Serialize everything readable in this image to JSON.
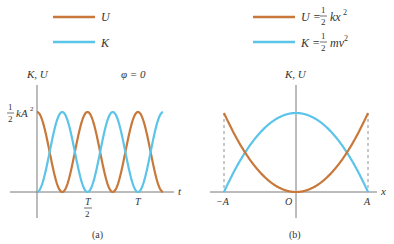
{
  "colors": {
    "U": "#c8783a",
    "K": "#5bc4e8",
    "axis": "#555555"
  },
  "legend_a": {
    "U_label": "U",
    "K_label": "K"
  },
  "legend_b": {
    "U_lhs": "U =",
    "U_frac_num": "1",
    "U_frac_den": "2",
    "U_rhs": "kx",
    "U_exp": "2",
    "K_lhs": "K =",
    "K_frac_num": "1",
    "K_frac_den": "2",
    "K_rhs": "mv",
    "K_exp": "2"
  },
  "panel_a": {
    "y_axis_label": "K, U",
    "phase_label": "φ = 0",
    "max_label_num": "1",
    "max_label_den": "2",
    "max_label_rhs": "kA",
    "max_label_exp": "2",
    "x_axis_label": "t",
    "tick_half_T_num": "T",
    "tick_half_T_den": "2",
    "tick_T": "T",
    "caption": "(a)"
  },
  "panel_b": {
    "y_axis_label": "K, U",
    "x_axis_label": "x",
    "tick_neg_A": "−A",
    "tick_O": "O",
    "tick_A": "A",
    "caption": "(b)"
  },
  "chart_data": [
    {
      "type": "line",
      "title": "(a) Energy vs time, φ = 0",
      "xlabel": "t",
      "ylabel": "K, U",
      "x_ticks": [
        "T/2",
        "T"
      ],
      "y_ticks": [
        "1/2 kA^2"
      ],
      "series": [
        {
          "name": "U",
          "formula": "(1/2)kA^2 cos^2(ωt)",
          "start": "max"
        },
        {
          "name": "K",
          "formula": "(1/2)kA^2 sin^2(ωt)",
          "start": "zero"
        }
      ],
      "x_range": [
        0,
        1.25
      ],
      "x_units": "T"
    },
    {
      "type": "line",
      "title": "(b) Energy vs position",
      "xlabel": "x",
      "ylabel": "K, U",
      "x_ticks": [
        "-A",
        "O",
        "A"
      ],
      "series": [
        {
          "name": "U",
          "formula": "U = (1/2)kx^2",
          "shape": "parabola, minimum at O"
        },
        {
          "name": "K",
          "formula": "K = (1/2)mv^2",
          "shape": "inverted parabola, maximum at O"
        }
      ],
      "x_range": [
        "-A",
        "A"
      ]
    }
  ]
}
